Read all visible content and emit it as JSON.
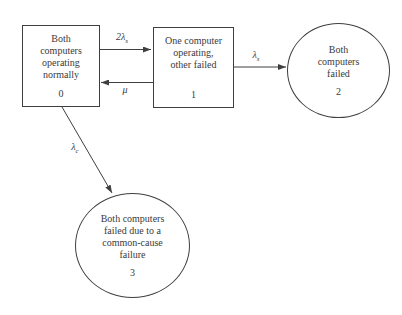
{
  "figure": {
    "background": "#ffffff",
    "line_color": "#3f3f3f",
    "text_color": "#3a3a3a",
    "nodes": [
      {
        "id": "0",
        "shape": "rectangle",
        "label": "Both\ncomputers\noperating\nnormally",
        "number": "0"
      },
      {
        "id": "1",
        "shape": "rectangle",
        "label": "One computer\noperating,\nother failed",
        "number": "1"
      },
      {
        "id": "2",
        "shape": "circle",
        "label": "Both\ncomputers\nfailed",
        "number": "2"
      },
      {
        "id": "3",
        "shape": "circle",
        "label": "Both computers\nfailed due to a\ncommon-cause\nfailure",
        "number": "3"
      }
    ],
    "transitions": [
      {
        "from": "0",
        "to": "1",
        "rate": "2λ",
        "subscript": "s"
      },
      {
        "from": "1",
        "to": "0",
        "rate": "μ",
        "subscript": ""
      },
      {
        "from": "1",
        "to": "2",
        "rate": "λ",
        "subscript": "s"
      },
      {
        "from": "0",
        "to": "3",
        "rate": "λ",
        "subscript": "c"
      }
    ]
  }
}
